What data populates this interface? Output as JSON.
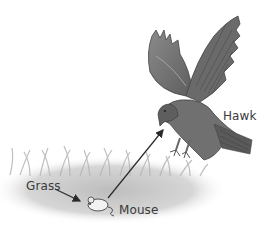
{
  "diagram": {
    "type": "food-chain",
    "labels": {
      "hawk": "Hawk",
      "grass": "Grass",
      "mouse": "Mouse"
    },
    "nodes": [
      {
        "id": "grass",
        "label": "Grass"
      },
      {
        "id": "mouse",
        "label": "Mouse"
      },
      {
        "id": "hawk",
        "label": "Hawk"
      }
    ],
    "edges": [
      {
        "from": "grass",
        "to": "mouse"
      },
      {
        "from": "mouse",
        "to": "hawk"
      }
    ],
    "colors": {
      "background": "#ffffff",
      "grass": "#c8c8c8",
      "hawk_body": "#6e6e6e",
      "hawk_dark": "#4a4a4a",
      "arrow": "#2a2a2a",
      "text": "#3a3a3a"
    }
  }
}
